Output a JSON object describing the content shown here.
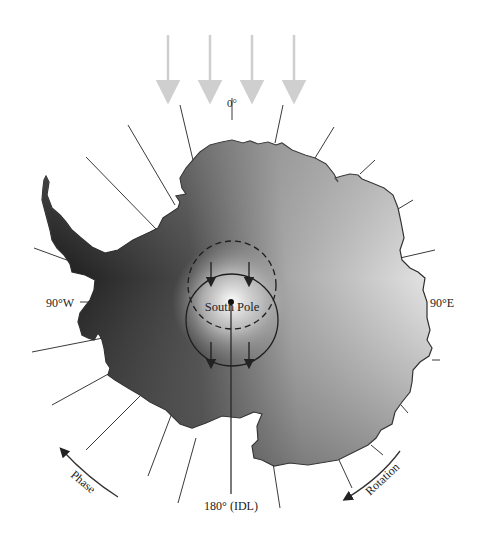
{
  "diagram": {
    "labels": {
      "top": "0°",
      "left": "90°W",
      "right": "90°E",
      "bottom": "180° (IDL)",
      "center": "South Pole",
      "phase": "Phase",
      "rotation": "Rotation"
    },
    "incoming_arrows": 4,
    "colors": {
      "arrow_gray": "#cfcfcf",
      "line": "#3a3a3a",
      "land_dark": "#1e1e1e",
      "land_light": "#e6e6e6"
    }
  }
}
